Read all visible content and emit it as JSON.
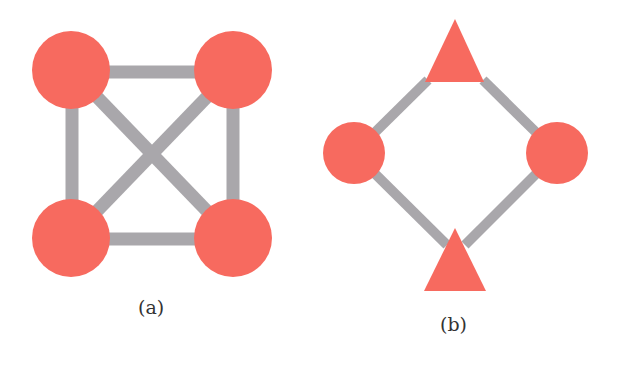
{
  "figure": {
    "colors": {
      "node": "#f76a5f",
      "edge": "#a9a7ab",
      "background": "#ffffff"
    },
    "panels": [
      {
        "label": "(a)",
        "description": "Complete graph K4 with four circular nodes",
        "nodes": [
          {
            "id": "a1",
            "shape": "circle",
            "cx": 71,
            "cy": 70,
            "r": 39
          },
          {
            "id": "a2",
            "shape": "circle",
            "cx": 233,
            "cy": 70,
            "r": 39
          },
          {
            "id": "a3",
            "shape": "circle",
            "cx": 71,
            "cy": 238,
            "r": 39
          },
          {
            "id": "a4",
            "shape": "circle",
            "cx": 233,
            "cy": 238,
            "r": 39
          }
        ],
        "edges": [
          [
            "a1",
            "a2"
          ],
          [
            "a1",
            "a3"
          ],
          [
            "a2",
            "a4"
          ],
          [
            "a3",
            "a4"
          ],
          [
            "a1",
            "a4"
          ],
          [
            "a2",
            "a3"
          ]
        ]
      },
      {
        "label": "(b)",
        "description": "Cycle of four nodes: two triangles and two circles",
        "nodes": [
          {
            "id": "b1",
            "shape": "triangle",
            "cx": 455,
            "cy": 55
          },
          {
            "id": "b2",
            "shape": "circle",
            "cx": 354,
            "cy": 153,
            "r": 31
          },
          {
            "id": "b3",
            "shape": "circle",
            "cx": 557,
            "cy": 153,
            "r": 31
          },
          {
            "id": "b4",
            "shape": "triangle",
            "cx": 455,
            "cy": 263
          }
        ],
        "edges": [
          [
            "b1",
            "b2"
          ],
          [
            "b1",
            "b3"
          ],
          [
            "b2",
            "b4"
          ],
          [
            "b3",
            "b4"
          ]
        ]
      }
    ]
  }
}
